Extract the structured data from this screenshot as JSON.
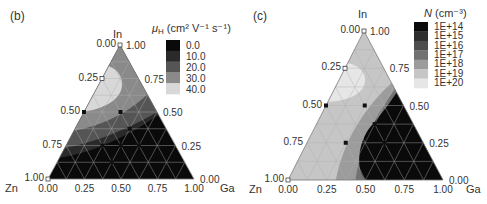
{
  "chart_data": [
    {
      "type": "heatmap",
      "subtype": "ternary-contour",
      "panel_label": "(b)",
      "title": "",
      "vertices": {
        "top": "In",
        "left": "Zn",
        "right": "Ga"
      },
      "axis_ticks": {
        "left_edge": [
          "0.00",
          "0.25",
          "0.50",
          "0.75",
          "1.00"
        ],
        "right_edge": [
          "1.00",
          "0.75",
          "0.50",
          "0.25",
          "0.00"
        ],
        "bottom_edge": [
          "0.00",
          "0.25",
          "0.50",
          "0.75",
          "1.00"
        ]
      },
      "legend": {
        "title": "μH (cm² V⁻¹ s⁻¹)",
        "title_main": "μ",
        "title_sub": "H",
        "title_rest": " (cm² V⁻¹ s⁻¹)",
        "levels": [
          "0.0",
          "10.0",
          "20.0",
          "30.0",
          "40.0"
        ],
        "colors": [
          "#0a0a0a",
          "#2a2a2a",
          "#555555",
          "#8a8a8a",
          "#d8d8d8"
        ]
      },
      "regions": [
        {
          "level": "40.0",
          "description": "light pocket near In-Zn edge at In≈0.5-0.75"
        },
        {
          "level": "30.0",
          "description": "band surrounding light pocket"
        },
        {
          "level": "20.0",
          "description": "band toward Ga-Zn"
        },
        {
          "level": "10.0",
          "description": "narrow band"
        },
        {
          "level": "0.0",
          "description": "Ga-rich and low-In region (bottom)"
        }
      ],
      "data_points_filled": [
        [
          0.5,
          0.5,
          0
        ],
        [
          0.5,
          0.25,
          0.25
        ],
        [
          0.25,
          0.5,
          0.25
        ],
        [
          0.25,
          0.25,
          0.5
        ],
        [
          0.375,
          0.25,
          0.375
        ],
        [
          0.25,
          0.375,
          0.375
        ],
        [
          0.125,
          0.5,
          0.375
        ],
        [
          0.75,
          0.25,
          0
        ]
      ],
      "data_points_open": [
        [
          1,
          0,
          0
        ],
        [
          0.75,
          0.25,
          0
        ],
        [
          0,
          1,
          0
        ]
      ]
    },
    {
      "type": "heatmap",
      "subtype": "ternary-contour",
      "panel_label": "(c)",
      "title": "",
      "vertices": {
        "top": "In",
        "left": "Zn",
        "right": "Ga"
      },
      "axis_ticks": {
        "left_edge": [
          "0.00",
          "0.25",
          "0.50",
          "0.75",
          "1.00"
        ],
        "right_edge": [
          "1.00",
          "0.75",
          "0.50",
          "0.25",
          "0.00"
        ],
        "bottom_edge": [
          "0.00",
          "0.25",
          "0.50",
          "0.75",
          "1.00"
        ]
      },
      "legend": {
        "title": "N (cm⁻³)",
        "title_main": "N",
        "title_rest": " (cm⁻³)",
        "levels": [
          "1E+14",
          "1E+15",
          "1E+16",
          "1E+17",
          "1E+18",
          "1E+19",
          "1E+20"
        ],
        "colors": [
          "#0a0a0a",
          "#2e2e2e",
          "#4e4e4e",
          "#727272",
          "#9c9c9c",
          "#c6c6c6",
          "#e6e6e6"
        ]
      },
      "regions": [
        {
          "level": "1E+20",
          "description": "light pocket near In-Zn edge"
        },
        {
          "level": "1E+19",
          "description": "large region covering In/Zn-rich side"
        },
        {
          "level": "1E+18",
          "description": "band"
        },
        {
          "level": "1E+17",
          "description": "narrow band"
        },
        {
          "level": "1E+14",
          "description": "Ga-rich black region"
        }
      ],
      "data_points_filled": [
        [
          0.5,
          0.5,
          0
        ],
        [
          0.5,
          0.25,
          0.25
        ],
        [
          0.25,
          0.5,
          0.25
        ],
        [
          0.25,
          0.25,
          0.5
        ],
        [
          0.375,
          0.25,
          0.375
        ],
        [
          0.75,
          0.25,
          0
        ]
      ],
      "data_points_open": [
        [
          1,
          0,
          0
        ],
        [
          0.75,
          0.25,
          0
        ],
        [
          0,
          1,
          0
        ]
      ]
    }
  ],
  "panels": {
    "b": {
      "label": "(b)",
      "top": "In",
      "left": "Zn",
      "right": "Ga"
    },
    "c": {
      "label": "(c)",
      "top": "In",
      "left": "Zn",
      "right": "Ga"
    }
  }
}
